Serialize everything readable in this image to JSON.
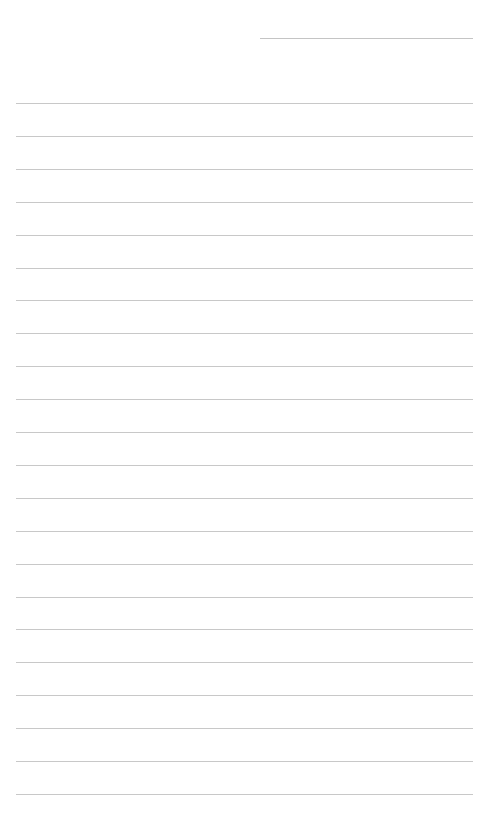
{
  "page": {
    "type": "lined-paper",
    "background_color": "#ffffff",
    "line_color": "#c8c8c8",
    "header_line": {
      "x": 260,
      "y": 38,
      "width": 213
    },
    "rules": {
      "count": 22,
      "start_y": 103,
      "spacing": 32.9,
      "x": 16,
      "width": 457
    }
  }
}
